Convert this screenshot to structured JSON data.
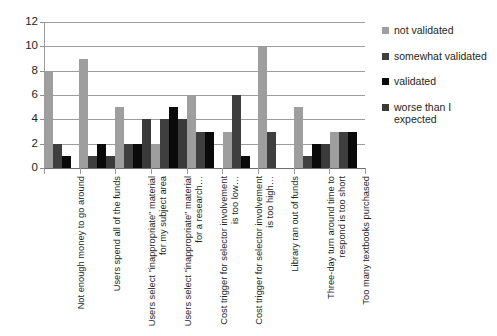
{
  "chart_data": {
    "type": "bar",
    "title": "",
    "xlabel": "",
    "ylabel": "",
    "ylim": [
      0,
      12
    ],
    "ytick_step": 2,
    "yticks": [
      12,
      10,
      8,
      6,
      4,
      2,
      0
    ],
    "grid": true,
    "legend_position": "right",
    "orientation": "vertical",
    "grouping": "grouped",
    "categories": [
      "Not enough money to go around",
      "Users spend all of the funds",
      "Users select \"inappropriate\" material for my subject area",
      "Users select \"inappropriate\" material for a research…",
      "Cost trigger for selector involvement is too low…",
      "Cost trigger for selector involvement is too high…",
      "Library ran out of funds",
      "Three-day turn around time to respond is too short",
      "Too many textbooks purchased"
    ],
    "series": [
      {
        "name": "not validated",
        "color": "#9e9e9e",
        "values": [
          8,
          9,
          5,
          2,
          6,
          3,
          10,
          5,
          3
        ]
      },
      {
        "name": "somewhat validated",
        "color": "#3f3f3f",
        "values": [
          2,
          1,
          2,
          4,
          3,
          6,
          3,
          1,
          3
        ]
      },
      {
        "name": "validated",
        "color": "#0a0a0a",
        "values": [
          1,
          2,
          2,
          5,
          3,
          1,
          null,
          2,
          3
        ]
      },
      {
        "name": "worse than I expected",
        "color": "#3a3a3a",
        "values": [
          null,
          1,
          4,
          4,
          null,
          null,
          null,
          2,
          null
        ]
      }
    ]
  },
  "axis": {
    "y_labels": [
      "12",
      "10",
      "8",
      "6",
      "4",
      "2",
      "0"
    ]
  },
  "legend": {
    "items": [
      {
        "label": "not validated",
        "color": "#9e9e9e"
      },
      {
        "label": "somewhat validated",
        "color": "#3f3f3f"
      },
      {
        "label": "validated",
        "color": "#0a0a0a"
      },
      {
        "label": "worse than I expected",
        "color": "#3a3a3a"
      }
    ]
  }
}
